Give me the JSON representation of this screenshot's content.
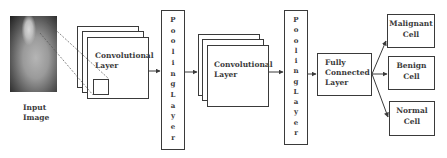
{
  "diagram": {
    "input": {
      "label_line1": "Input",
      "label_line2": "Image"
    },
    "conv1": {
      "label_line1": "Convolutional",
      "label_line2": "Layer"
    },
    "pool1": {
      "letters": [
        "P",
        "o",
        "o",
        "l",
        "i",
        "n",
        "g",
        "L",
        "a",
        "y",
        "e",
        "r"
      ]
    },
    "conv2": {
      "label_line1": "Convolutional",
      "label_line2": "Layer"
    },
    "pool2": {
      "letters": [
        "P",
        "o",
        "o",
        "l",
        "i",
        "n",
        "g",
        "L",
        "a",
        "y",
        "e",
        "r"
      ]
    },
    "fc": {
      "label_line1": "Fully",
      "label_line2": "Connected",
      "label_line3": "Layer"
    },
    "outputs": [
      {
        "line1": "Malignant",
        "line2": "Cell"
      },
      {
        "line1": "Benign",
        "line2": "Cell"
      },
      {
        "line1": "Normal",
        "line2": "Cell"
      }
    ],
    "colors": {
      "stroke": "#3a3a3a",
      "text": "#3b3b3b",
      "background": "#ffffff"
    }
  }
}
